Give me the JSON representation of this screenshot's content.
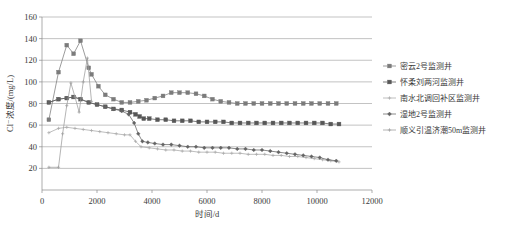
{
  "chart_data": {
    "type": "line",
    "title": "",
    "xlabel": "时间/d",
    "ylabel": "Cl⁻浓度/(mg/L)",
    "xlim": [
      0,
      12000
    ],
    "ylim": [
      0,
      160
    ],
    "xticks": [
      0,
      2000,
      4000,
      6000,
      8000,
      10000,
      12000
    ],
    "yticks": [
      20,
      40,
      60,
      80,
      100,
      120,
      140,
      160
    ],
    "grid": "horizontal",
    "legend_position": "right",
    "series": [
      {
        "name": "密云2号监测井",
        "color": "#7b7b7b",
        "marker": "square",
        "x": [
          250,
          600,
          900,
          1150,
          1400,
          1700,
          1800,
          2050,
          2300,
          2600,
          2900,
          3200,
          3500,
          3800,
          4100,
          4400,
          4700,
          5000,
          5300,
          5600,
          5900,
          6200,
          6500,
          6800,
          7100,
          7400,
          7700,
          8000,
          8300,
          8600,
          8900,
          9200,
          9500,
          9800,
          10100,
          10400,
          10700
        ],
        "y": [
          65,
          109,
          134,
          126,
          138,
          113,
          107,
          96,
          88,
          84,
          81,
          81,
          82,
          83,
          85,
          87,
          90,
          90,
          90,
          89,
          87,
          84,
          82,
          81,
          80,
          80,
          80,
          80,
          80,
          80,
          80,
          80,
          80,
          80,
          80,
          80,
          80
        ]
      },
      {
        "name": "怀柔刘两河监测井",
        "color": "#575757",
        "marker": "square",
        "x": [
          250,
          600,
          900,
          1150,
          1400,
          1700,
          2000,
          2300,
          2600,
          2900,
          3200,
          3400,
          3550,
          3700,
          3900,
          4200,
          4500,
          4800,
          5100,
          5400,
          5700,
          6000,
          6300,
          6600,
          6900,
          7200,
          7500,
          7800,
          8100,
          8400,
          8700,
          9000,
          9300,
          9600,
          9900,
          10200,
          10500,
          10800
        ],
        "y": [
          81,
          84,
          85,
          86,
          84,
          81,
          79,
          77,
          75,
          74,
          72,
          70,
          68,
          66,
          66,
          65,
          65,
          64,
          64,
          64,
          63,
          63,
          63,
          63,
          62,
          62,
          62,
          62,
          62,
          62,
          62,
          62,
          62,
          62,
          62,
          62,
          61,
          61
        ]
      },
      {
        "name": "南水北调回补区监测井",
        "color": "#a8a8a8",
        "marker": "plus",
        "x": [
          250,
          600,
          900,
          1200,
          1500,
          1800,
          2100,
          2400,
          2700,
          3000,
          3200,
          3400,
          3600,
          3900,
          4200,
          4500,
          4800,
          5100,
          5400,
          5700,
          6000,
          6300,
          6600,
          6900,
          7200,
          7500,
          7800,
          8100,
          8400,
          8700,
          9000,
          9300,
          9600,
          9900,
          10200,
          10500,
          10800
        ],
        "y": [
          53,
          57,
          58,
          57,
          56,
          55,
          54,
          53,
          52,
          51,
          51,
          45,
          40,
          39,
          38,
          37,
          37,
          36,
          36,
          35,
          35,
          35,
          34,
          34,
          34,
          33,
          33,
          33,
          32,
          32,
          31,
          31,
          30,
          29,
          28,
          27,
          26
        ]
      },
      {
        "name": "湿地2号监测井",
        "color": "#636363",
        "marker": "diamond",
        "x": [
          250,
          600,
          900,
          1150,
          1400,
          1700,
          2000,
          2300,
          2600,
          2900,
          3150,
          3350,
          3500,
          3650,
          3850,
          4100,
          4400,
          4700,
          5000,
          5300,
          5600,
          5900,
          6200,
          6500,
          6800,
          7100,
          7400,
          7700,
          8000,
          8300,
          8600,
          8900,
          9200,
          9500,
          9800,
          10100,
          10400,
          10700
        ],
        "y": [
          81,
          84,
          85,
          86,
          84,
          81,
          79,
          77,
          75,
          73,
          70,
          62,
          52,
          45,
          44,
          43,
          42,
          42,
          41,
          40,
          40,
          39,
          39,
          39,
          39,
          38,
          38,
          37,
          37,
          36,
          35,
          34,
          33,
          32,
          31,
          30,
          28,
          27
        ]
      },
      {
        "name": "顺义引温济潮50m监测井",
        "color": "#9c9c9c",
        "marker": "plus",
        "x": [
          250,
          600,
          750,
          900,
          1050,
          1200,
          1350,
          1500,
          1650,
          1800
        ],
        "y": [
          21,
          21,
          52,
          78,
          99,
          86,
          72,
          100,
          122,
          82
        ]
      }
    ]
  },
  "legend": {
    "items": [
      {
        "label": "密云2号监测井"
      },
      {
        "label": "怀柔刘两河监测井"
      },
      {
        "label": "南水北调回补区监测井"
      },
      {
        "label": "湿地2号监测井"
      },
      {
        "label": "顺义引温济潮50m监测井"
      }
    ]
  },
  "axes": {
    "x_title": "时间/d",
    "y_title": "Cl⁻浓度/(mg/L)",
    "x_tick_labels": [
      "0",
      "2000",
      "4000",
      "6000",
      "8000",
      "10000",
      "12000"
    ],
    "y_tick_labels": [
      "20",
      "40",
      "60",
      "80",
      "100",
      "120",
      "140",
      "160"
    ]
  }
}
